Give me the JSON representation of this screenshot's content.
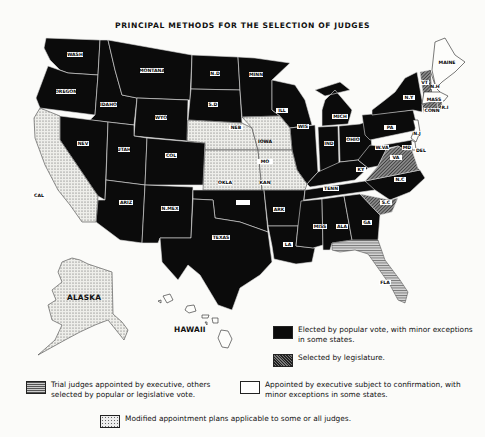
{
  "title": "PRINCIPAL METHODS FOR THE SELECTION OF JUDGES",
  "colors": {
    "elected": "#0b0b0b",
    "legislature": "#555555",
    "trial_appointed": "#9a9a9a",
    "appointed": "#ffffff",
    "modified": "#e8e8e8"
  },
  "states": [
    {
      "abbr": "WASH",
      "method": "elected"
    },
    {
      "abbr": "OREGON",
      "method": "elected"
    },
    {
      "abbr": "CAL",
      "method": "modified"
    },
    {
      "abbr": "IDAHO",
      "method": "elected"
    },
    {
      "abbr": "NEV",
      "method": "elected"
    },
    {
      "abbr": "MONTANA",
      "method": "elected"
    },
    {
      "abbr": "WYO",
      "method": "elected"
    },
    {
      "abbr": "UTAH",
      "method": "elected"
    },
    {
      "abbr": "COL",
      "method": "elected"
    },
    {
      "abbr": "ARIZ",
      "method": "elected"
    },
    {
      "abbr": "N.MEX",
      "method": "elected"
    },
    {
      "abbr": "N.D",
      "method": "elected"
    },
    {
      "abbr": "S.D",
      "method": "elected"
    },
    {
      "abbr": "NEB",
      "method": "modified"
    },
    {
      "abbr": "KAN",
      "method": "modified"
    },
    {
      "abbr": "OKLA",
      "method": "elected"
    },
    {
      "abbr": "TEXAS",
      "method": "elected"
    },
    {
      "abbr": "MINN",
      "method": "elected"
    },
    {
      "abbr": "IOWA",
      "method": "modified"
    },
    {
      "abbr": "MO",
      "method": "modified"
    },
    {
      "abbr": "ARK",
      "method": "elected"
    },
    {
      "abbr": "LA",
      "method": "elected"
    },
    {
      "abbr": "WIS",
      "method": "elected"
    },
    {
      "abbr": "ILL",
      "method": "elected"
    },
    {
      "abbr": "MICH",
      "method": "elected"
    },
    {
      "abbr": "IND",
      "method": "elected"
    },
    {
      "abbr": "OHIO",
      "method": "elected"
    },
    {
      "abbr": "KY",
      "method": "elected"
    },
    {
      "abbr": "TENN",
      "method": "elected"
    },
    {
      "abbr": "MISS",
      "method": "elected"
    },
    {
      "abbr": "ALA",
      "method": "elected"
    },
    {
      "abbr": "GA",
      "method": "elected"
    },
    {
      "abbr": "FLA",
      "method": "trial_appointed"
    },
    {
      "abbr": "S.C",
      "method": "legislature"
    },
    {
      "abbr": "N.C",
      "method": "elected"
    },
    {
      "abbr": "VA",
      "method": "legislature"
    },
    {
      "abbr": "W.VA",
      "method": "elected"
    },
    {
      "abbr": "PA",
      "method": "elected"
    },
    {
      "abbr": "N.Y",
      "method": "elected"
    },
    {
      "abbr": "MD",
      "method": "elected"
    },
    {
      "abbr": "DEL",
      "method": "appointed"
    },
    {
      "abbr": "N.J",
      "method": "appointed"
    },
    {
      "abbr": "CONN",
      "method": "legislature"
    },
    {
      "abbr": "R.I",
      "method": "legislature"
    },
    {
      "abbr": "MASS",
      "method": "appointed"
    },
    {
      "abbr": "VT",
      "method": "legislature"
    },
    {
      "abbr": "N.H",
      "method": "appointed"
    },
    {
      "abbr": "MAINE",
      "method": "appointed"
    },
    {
      "abbr": "ALASKA",
      "method": "modified"
    },
    {
      "abbr": "HAWAII",
      "method": "appointed"
    }
  ],
  "labels": {
    "alaska": "ALASKA",
    "hawaii": "HAWAII"
  },
  "legend": {
    "elected": "Elected by popular vote, with minor exceptions in some states.",
    "legislature": "Selected by legislature.",
    "trial_appointed": "Trial judges appointed by executive, others selected by popular or legislative vote.",
    "appointed": "Appointed by executive subject to confirmation, with minor exceptions in some states.",
    "modified": "Modified appointment plans applicable to some or all judges."
  }
}
